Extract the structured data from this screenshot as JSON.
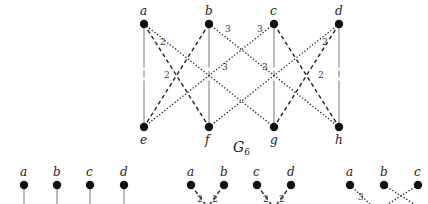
{
  "graph": {
    "title": "G",
    "title_subscript": "6",
    "nodes": [
      {
        "id": "a",
        "label": "a",
        "x": 144,
        "y": 24,
        "label_pos": "top"
      },
      {
        "id": "b",
        "label": "b",
        "x": 209,
        "y": 24,
        "label_pos": "top"
      },
      {
        "id": "c",
        "label": "c",
        "x": 274,
        "y": 24,
        "label_pos": "top"
      },
      {
        "id": "d",
        "label": "d",
        "x": 339,
        "y": 24,
        "label_pos": "top"
      },
      {
        "id": "e",
        "label": "e",
        "x": 144,
        "y": 127,
        "label_pos": "bottom"
      },
      {
        "id": "f",
        "label": "f",
        "x": 209,
        "y": 127,
        "label_pos": "bottom"
      },
      {
        "id": "g",
        "label": "g",
        "x": 274,
        "y": 127,
        "label_pos": "bottom"
      },
      {
        "id": "h",
        "label": "h",
        "x": 339,
        "y": 127,
        "label_pos": "bottom"
      }
    ],
    "edges": [
      {
        "from": "a",
        "to": "e",
        "style": "solid",
        "weight": "1"
      },
      {
        "from": "b",
        "to": "f",
        "style": "solid",
        "weight": "1"
      },
      {
        "from": "c",
        "to": "g",
        "style": "solid",
        "weight": "1"
      },
      {
        "from": "d",
        "to": "h",
        "style": "solid",
        "weight": "1"
      },
      {
        "from": "a",
        "to": "f",
        "style": "dashed",
        "weight": "2",
        "lx": 160,
        "ly": 45
      },
      {
        "from": "b",
        "to": "e",
        "style": "dashed",
        "weight": "2",
        "lx": 164,
        "ly": 78
      },
      {
        "from": "c",
        "to": "h",
        "style": "dashed",
        "weight": "2",
        "lx": 322,
        "ly": 45
      },
      {
        "from": "d",
        "to": "g",
        "style": "dashed",
        "weight": "2",
        "lx": 318,
        "ly": 78
      },
      {
        "from": "a",
        "to": "g",
        "style": "dotted",
        "weight": "3",
        "lx": 222,
        "ly": 70
      },
      {
        "from": "b",
        "to": "h",
        "style": "dotted",
        "weight": "3",
        "lx": 225,
        "ly": 32
      },
      {
        "from": "c",
        "to": "e",
        "style": "dotted",
        "weight": "3",
        "lx": 257,
        "ly": 32
      },
      {
        "from": "d",
        "to": "f",
        "style": "dotted",
        "weight": "3",
        "lx": 262,
        "ly": 70
      }
    ]
  },
  "subgraphs": [
    {
      "name": "matching-1",
      "nodes": [
        {
          "label": "a",
          "x": 24,
          "y": 185
        },
        {
          "label": "b",
          "x": 57,
          "y": 185
        },
        {
          "label": "c",
          "x": 90,
          "y": 185
        },
        {
          "label": "d",
          "x": 124,
          "y": 185
        }
      ],
      "edge_style": "solid"
    },
    {
      "name": "matching-2",
      "nodes": [
        {
          "label": "a",
          "x": 191,
          "y": 185
        },
        {
          "label": "b",
          "x": 224,
          "y": 185
        },
        {
          "label": "c",
          "x": 257,
          "y": 185
        },
        {
          "label": "d",
          "x": 291,
          "y": 185
        }
      ],
      "edge_style": "dashed",
      "weights": [
        "2",
        "2",
        "2",
        "2"
      ]
    },
    {
      "name": "matching-3",
      "nodes": [
        {
          "label": "a",
          "x": 350,
          "y": 185
        },
        {
          "label": "b",
          "x": 384,
          "y": 185
        },
        {
          "label": "c",
          "x": 418,
          "y": 185
        }
      ],
      "edge_style": "dotted",
      "weights": [
        "3"
      ]
    }
  ]
}
